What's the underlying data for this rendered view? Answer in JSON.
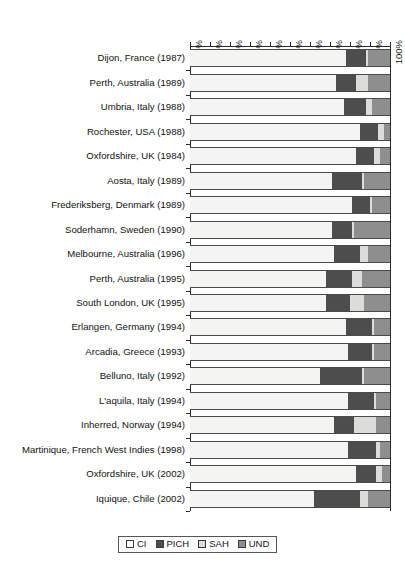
{
  "chart_data": {
    "type": "bar",
    "orientation": "horizontal",
    "stacked": true,
    "stack_mode": "percent",
    "title": "",
    "subtitle": "",
    "xlabel": "",
    "ylabel": "",
    "xlim": [
      0,
      100
    ],
    "grid": false,
    "legend_position": "bottom-center",
    "xticks": [
      "0%",
      "10%",
      "20%",
      "30%",
      "40%",
      "50%",
      "60%",
      "70%",
      "80%",
      "90%",
      "100%"
    ],
    "xtick_values": [
      0,
      10,
      20,
      30,
      40,
      50,
      60,
      70,
      80,
      90,
      100
    ],
    "categories": [
      "Dijon, France (1987)",
      "Perth, Australia (1989)",
      "Umbria, Italy (1988)",
      "Rochester, USA (1988)",
      "Oxfordshire, UK (1984)",
      "Aosta, Italy (1989)",
      "Frederiksberg, Denmark (1989)",
      "Soderhamn, Sweden (1990)",
      "Melbourne, Australia (1996)",
      "Perth, Australia (1995)",
      "South London, UK (1995)",
      "Erlangen, Germany (1994)",
      "Arcadia, Greece (1993)",
      "Belluno, Italy (1992)",
      "L'aquila, Italy (1994)",
      "Inherred, Norway (1994)",
      "Martinique, French West Indies (1998)",
      "Oxfordshire, UK (2002)",
      "Iquique, Chile (2002)"
    ],
    "series": [
      {
        "name": "CI",
        "color": "#f4f4f2",
        "values": [
          78,
          73,
          77,
          85,
          83,
          71,
          81,
          71,
          72,
          68,
          68,
          78,
          79,
          65,
          79,
          72,
          79,
          83,
          62
        ]
      },
      {
        "name": "PICH",
        "color": "#4d4d4d",
        "values": [
          10,
          10,
          11,
          9,
          9,
          15,
          9,
          10,
          13,
          13,
          12,
          13,
          12,
          21,
          13,
          10,
          14,
          10,
          23
        ]
      },
      {
        "name": "SAH",
        "color": "#dcdcd8",
        "values": [
          1,
          6,
          3,
          3,
          3,
          1,
          1,
          1,
          4,
          5,
          7,
          1,
          1,
          1,
          1,
          11,
          2,
          3,
          4
        ]
      },
      {
        "name": "UND",
        "color": "#8e8e8e",
        "values": [
          11,
          11,
          9,
          3,
          5,
          13,
          9,
          18,
          11,
          14,
          13,
          8,
          8,
          13,
          7,
          7,
          5,
          4,
          11
        ]
      }
    ]
  },
  "legend": {
    "items": [
      {
        "label": "CI",
        "color": "#ffffff"
      },
      {
        "label": "PICH",
        "color": "#4d4d4d"
      },
      {
        "label": "SAH",
        "color": "#dcdcd8"
      },
      {
        "label": "UND",
        "color": "#8e8e8e"
      }
    ]
  }
}
